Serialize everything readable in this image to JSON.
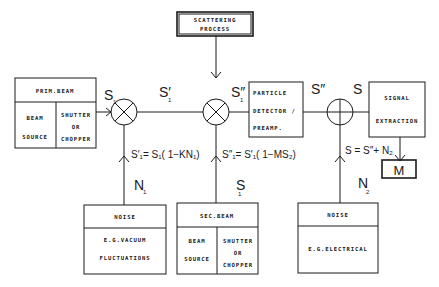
{
  "diagram": {
    "type": "block-diagram",
    "blocks": {
      "scattering": {
        "line1": "SCATTERING",
        "line2": "PROCESS"
      },
      "prim_beam": {
        "title": "PRIM.BEAM",
        "left1": "BEAM",
        "left2": "SOURCE",
        "right1": "SHUTTER",
        "right2": "OR",
        "right3": "CHOPPER"
      },
      "detector": {
        "line1": "PARTICLE",
        "line2": "DETECTOR /",
        "line3": "PREAMP."
      },
      "signal_extraction": {
        "line1": "SIGNAL",
        "line2": "EXTRACTION"
      },
      "meter": {
        "label": "M"
      },
      "noise1": {
        "title": "NOISE",
        "line1": "E.G.VACUUM",
        "line2": "FLUCTUATIONS"
      },
      "sec_beam": {
        "title": "SEC.BEAM",
        "left1": "BEAM",
        "left2": "SOURCE",
        "right1": "SHUTTER",
        "right2": "OR",
        "right3": "CHOPPER"
      },
      "noise2": {
        "title": "NOISE",
        "line1": "E.G.ELECTRICAL"
      }
    },
    "nodes": {
      "mixer1": "multiplier",
      "mixer2": "multiplier",
      "adder": "summer"
    },
    "signal_labels": {
      "s1": {
        "base": "S",
        "sub": "1"
      },
      "s1p": {
        "base": "S′",
        "sub": "1"
      },
      "s1pp": {
        "base": "S″",
        "sub": "1"
      },
      "spp": {
        "base": "S″"
      },
      "s": {
        "base": "S"
      },
      "n1": {
        "base": "N",
        "sub": "1"
      },
      "s1_sec": {
        "base": "S",
        "sub": "1"
      },
      "n2": {
        "base": "N",
        "sub": "2"
      }
    },
    "equations": {
      "eq1": "S′₁= S₁( 1−KN₁)",
      "eq2": "S″₁= S′₁( 1−MS₂)",
      "eq3": "S = S″+ N₂"
    }
  }
}
